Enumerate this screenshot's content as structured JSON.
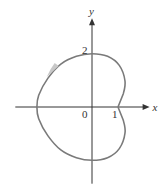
{
  "chart_data": {
    "type": "line",
    "title": "",
    "xlabel": "x",
    "ylabel": "y",
    "origin_label": "0",
    "tick_labels": {
      "x": [
        {
          "value": 1,
          "label": "1"
        }
      ],
      "y": [
        {
          "value": 2,
          "label": "2"
        }
      ]
    },
    "xlim": [
      -2.95,
      2.1
    ],
    "ylim": [
      -2.95,
      3.3
    ],
    "grid": false,
    "legend": "none",
    "series": [
      {
        "name": "closed curve",
        "closed": true,
        "direction": "counterclockwise",
        "color": "#7a7a7a",
        "points": [
          [
            1.0,
            0.0
          ],
          [
            1.2,
            0.5
          ],
          [
            1.27,
            1.0
          ],
          [
            1.05,
            1.6
          ],
          [
            0.6,
            1.95
          ],
          [
            0.0,
            2.05
          ],
          [
            -0.6,
            1.95
          ],
          [
            -1.2,
            1.65
          ],
          [
            -1.7,
            1.1
          ],
          [
            -2.05,
            0.45
          ],
          [
            -2.12,
            0.0
          ],
          [
            -2.05,
            -0.45
          ],
          [
            -1.7,
            -1.1
          ],
          [
            -1.2,
            -1.65
          ],
          [
            -0.6,
            -1.95
          ],
          [
            0.0,
            -2.05
          ],
          [
            0.6,
            -1.95
          ],
          [
            1.05,
            -1.6
          ],
          [
            1.27,
            -1.0
          ],
          [
            1.2,
            -0.5
          ],
          [
            1.0,
            0.0
          ]
        ]
      }
    ],
    "annotations": [
      {
        "type": "direction-arrow",
        "at": [
          -1.55,
          1.35
        ],
        "meaning": "counterclockwise traversal"
      }
    ]
  }
}
